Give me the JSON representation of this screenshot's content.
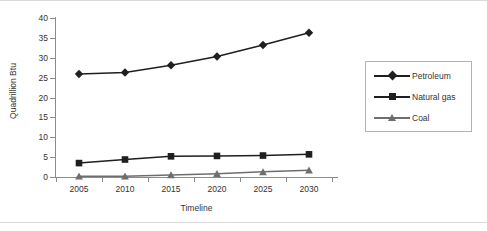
{
  "chart_data": {
    "type": "line",
    "title": "",
    "subtitle": "",
    "xlabel": "Timeline",
    "ylabel": "Quadrillion Btu",
    "x": [
      2005,
      2010,
      2015,
      2020,
      2025,
      2030
    ],
    "categories": [
      "2005",
      "2010",
      "2015",
      "2020",
      "2025",
      "2030"
    ],
    "xtick_labels": [
      "2005",
      "2010",
      "2015",
      "2020",
      "2025",
      "2030"
    ],
    "ytick_labels": [
      "0",
      "5",
      "10",
      "15",
      "20",
      "25",
      "30",
      "35",
      "40"
    ],
    "ytick_values": [
      0,
      5,
      10,
      15,
      20,
      25,
      30,
      35,
      40
    ],
    "ylim": [
      0,
      40
    ],
    "grid": false,
    "legend_position": "right",
    "series": [
      {
        "name": "Petroleum",
        "marker": "diamond",
        "color": "#1f1f1f",
        "values": [
          25.9,
          26.3,
          28.1,
          30.3,
          33.2,
          36.3
        ]
      },
      {
        "name": "Natural gas",
        "marker": "square",
        "color": "#1f1f1f",
        "values": [
          3.5,
          4.4,
          5.2,
          5.3,
          5.4,
          5.7
        ]
      },
      {
        "name": "Coal",
        "marker": "triangle",
        "color": "#6e6e6e",
        "values": [
          0.2,
          0.2,
          0.5,
          0.8,
          1.3,
          1.7
        ]
      }
    ]
  },
  "legend": {
    "items": [
      {
        "label": "Petroleum"
      },
      {
        "label": "Natural gas"
      },
      {
        "label": "Coal"
      }
    ]
  },
  "colors": {
    "axis": "#8c8c8c",
    "text": "#333333",
    "petroleum": "#1f1f1f",
    "natural_gas": "#1f1f1f",
    "coal": "#6e6e6e",
    "legend_border": "#b3b3b3",
    "page_edge": "#d9d9d9"
  }
}
